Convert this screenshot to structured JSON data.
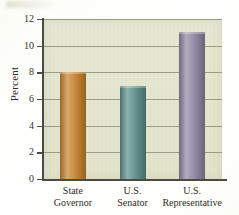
{
  "chart_data": {
    "type": "bar",
    "title": "",
    "xlabel": "",
    "ylabel": "Percent",
    "categories": [
      "State\nGovernor",
      "U.S.\nSenator",
      "U.S.\nRepresentative"
    ],
    "values": [
      8,
      7,
      11
    ],
    "ylim": [
      0,
      12
    ],
    "yticks": [
      0,
      2,
      4,
      6,
      8,
      10,
      12
    ],
    "ytick_labels": [
      "0",
      "2",
      "4",
      "6",
      "8",
      "10",
      "12"
    ],
    "grid": true,
    "legend": "none",
    "bar_colors": [
      "#c8832f",
      "#5d8f8c",
      "#8e87a3"
    ],
    "plot_background": "#e2e4cb",
    "figure_background": "#fbfbf4",
    "axis_color": "#4b4b44",
    "gridline_color": "#8d8f78"
  }
}
